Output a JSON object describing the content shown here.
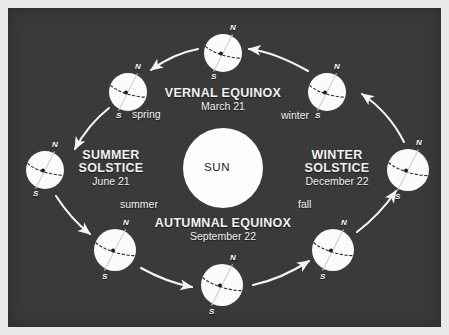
{
  "figure": {
    "background_color": "#3a3a3a",
    "border_color": "#e9e9e9",
    "body_color": "#ffffff",
    "text_color": "#f2f2f2",
    "sun_text_color": "#242424"
  },
  "sun": {
    "label": "SUN",
    "cx": 215,
    "cy": 160,
    "r": 40
  },
  "events": [
    {
      "id": "vernal-equinox",
      "name": "VERNAL EQUINOX",
      "date": "March 21",
      "x": 215,
      "y": 86
    },
    {
      "id": "summer-solstice",
      "name": "SUMMER\nSOLSTICE",
      "name_line1": "SUMMER",
      "name_line2": "SOLSTICE",
      "date": "June 21",
      "x": 103,
      "y": 148
    },
    {
      "id": "winter-solstice",
      "name": "WINTER\nSOLSTICE",
      "name_line1": "WINTER",
      "name_line2": "SOLSTICE",
      "date": "December 22",
      "x": 329,
      "y": 148
    },
    {
      "id": "autumnal-equinox",
      "name": "AUTUMNAL EQUINOX",
      "date": "September 22",
      "x": 215,
      "y": 216
    }
  ],
  "seasons": [
    {
      "id": "spring",
      "label": "spring",
      "x": 122,
      "y": 106
    },
    {
      "id": "winter",
      "label": "winter",
      "x": 275,
      "y": 108
    },
    {
      "id": "summer",
      "label": "summer",
      "x": 110,
      "y": 195
    },
    {
      "id": "fall",
      "label": "fall",
      "x": 290,
      "y": 195
    }
  ],
  "earths": [
    {
      "id": "earth-vernal-equinox",
      "position": "top",
      "cx": 215,
      "cy": 45,
      "r": 19,
      "north_pole": {
        "label": "N",
        "dx": 9,
        "dy": -27
      },
      "south_pole": {
        "label": "S",
        "dx": -10,
        "dy": 22
      }
    },
    {
      "id": "earth-spring",
      "position": "upper-left",
      "cx": 120,
      "cy": 84,
      "r": 19,
      "north_pole": {
        "label": "N",
        "dx": 9,
        "dy": -27
      },
      "south_pole": {
        "label": "S",
        "dx": -10,
        "dy": 22
      }
    },
    {
      "id": "earth-summer-solstice",
      "position": "left",
      "cx": 37,
      "cy": 162,
      "r": 19,
      "north_pole": {
        "label": "N",
        "dx": 9,
        "dy": -27
      },
      "south_pole": {
        "label": "S",
        "dx": -10,
        "dy": 22
      }
    },
    {
      "id": "earth-summer",
      "position": "lower-left",
      "cx": 107,
      "cy": 242,
      "r": 21,
      "north_pole": {
        "label": "N",
        "dx": 9,
        "dy": -29
      },
      "south_pole": {
        "label": "S",
        "dx": -11,
        "dy": 24
      }
    },
    {
      "id": "earth-autumnal-equinox",
      "position": "bottom",
      "cx": 214,
      "cy": 277,
      "r": 21,
      "north_pole": {
        "label": "N",
        "dx": 9,
        "dy": -29
      },
      "south_pole": {
        "label": "S",
        "dx": -11,
        "dy": 24
      }
    },
    {
      "id": "earth-fall",
      "position": "lower-right",
      "cx": 325,
      "cy": 242,
      "r": 21,
      "north_pole": {
        "label": "N",
        "dx": 9,
        "dy": -29
      },
      "south_pole": {
        "label": "S",
        "dx": -11,
        "dy": 24
      }
    },
    {
      "id": "earth-winter-solstice",
      "position": "right",
      "cx": 400,
      "cy": 162,
      "r": 21,
      "north_pole": {
        "label": "N",
        "dx": 9,
        "dy": -29
      },
      "south_pole": {
        "label": "S",
        "dx": -11,
        "dy": 24
      }
    },
    {
      "id": "earth-winter",
      "position": "upper-right",
      "cx": 319,
      "cy": 84,
      "r": 19,
      "north_pole": {
        "label": "N",
        "dx": 9,
        "dy": -27
      },
      "south_pole": {
        "label": "S",
        "dx": -10,
        "dy": 22
      }
    }
  ],
  "orbit": {
    "direction": "counterclockwise",
    "arrow_color": "#f5f5f5"
  }
}
